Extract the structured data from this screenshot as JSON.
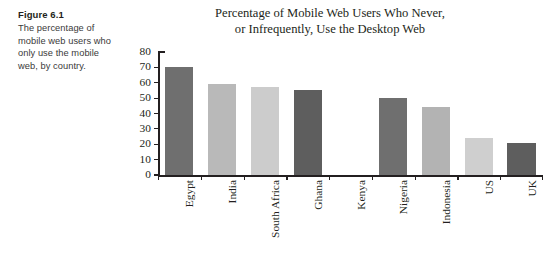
{
  "figure": {
    "label": "Figure 6.1",
    "caption": "The percentage of mobile web users who only use the mobile web, by country."
  },
  "chart_data": {
    "type": "bar",
    "title": "Percentage of Mobile Web Users Who Never, or Infrequently, Use the Desktop Web",
    "title_lines": [
      "Percentage of Mobile Web Users Who Never,",
      "or Infrequently, Use the Desktop Web"
    ],
    "xlabel": "",
    "ylabel": "",
    "ylim": [
      0,
      80
    ],
    "ytick_labels": [
      "80",
      "70",
      "60",
      "50",
      "40",
      "30",
      "20",
      "10",
      "0"
    ],
    "yticks": [
      80,
      70,
      60,
      50,
      40,
      30,
      20,
      10,
      0
    ],
    "grid": false,
    "legend": false,
    "categories": [
      "Egypt",
      "India",
      "South Africa",
      "Ghana",
      "Kenya",
      "Nigeria",
      "Indonesia",
      "US",
      "UK"
    ],
    "values": [
      70,
      59,
      57,
      55,
      0,
      50,
      44,
      24,
      21
    ],
    "bar_colors": [
      "#6f6f6f",
      "#b9b9b9",
      "#cccccc",
      "#5e5e5e",
      "#ffffff",
      "#6f6f6f",
      "#b3b3b3",
      "#cfcfcf",
      "#5e5e5e"
    ],
    "axis_color": "#231f20"
  }
}
